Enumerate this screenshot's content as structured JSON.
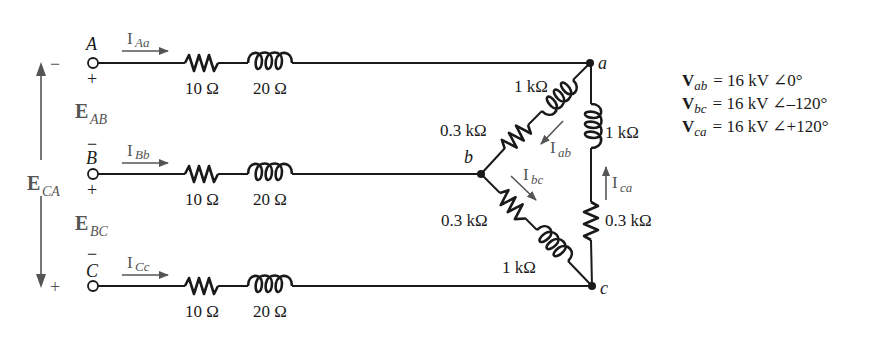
{
  "terminals": {
    "A": "A",
    "B": "B",
    "C": "C"
  },
  "polarity": {
    "A_minus": "−",
    "A_plus": "+",
    "B_minus": "−",
    "B_plus": "+",
    "C_minus": "−",
    "CA_minus": "−",
    "CA_plus": "+"
  },
  "source_voltages": {
    "E_AB": {
      "main": "E",
      "sub": "AB"
    },
    "E_BC": {
      "main": "E",
      "sub": "BC"
    },
    "E_CA": {
      "main": "E",
      "sub": "CA"
    }
  },
  "line_currents": {
    "I_Aa": {
      "main": "I",
      "sub": "Aa"
    },
    "I_Bb": {
      "main": "I",
      "sub": "Bb"
    },
    "I_Cc": {
      "main": "I",
      "sub": "Cc"
    }
  },
  "line_impedance": {
    "resistor": "10 Ω",
    "inductor": "20 Ω"
  },
  "load_nodes": {
    "a": "a",
    "b": "b",
    "c": "c"
  },
  "load_branches": {
    "ab": {
      "inductor": "1 kΩ",
      "resistor": "0.3 kΩ",
      "current": {
        "main": "I",
        "sub": "ab"
      }
    },
    "bc": {
      "resistor": "0.3 kΩ",
      "inductor": "1 kΩ",
      "current": {
        "main": "I",
        "sub": "bc"
      }
    },
    "ca": {
      "inductor": "1 kΩ",
      "resistor": "0.3 kΩ",
      "current": {
        "main": "I",
        "sub": "ca"
      }
    }
  },
  "equations": [
    {
      "var": "V",
      "sub": "ab",
      "rest": "=  16 kV ∠0°"
    },
    {
      "var": "V",
      "sub": "bc",
      "rest": "=  16 kV ∠–120°"
    },
    {
      "var": "V",
      "sub": "ca",
      "rest": "=  16 kV ∠+120°"
    }
  ],
  "colors": {
    "wire": "#1a1a1a",
    "annotation": "#555555",
    "background": "#ffffff"
  }
}
